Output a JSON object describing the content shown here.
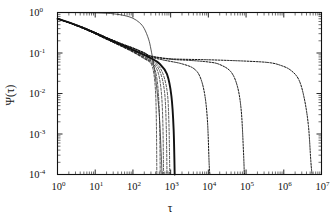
{
  "figure": {
    "title": "",
    "background": "#ffffff",
    "ink": "#111111"
  },
  "axes": {
    "xlabel": "τ",
    "ylabel": "Ψ(τ)",
    "xticks": [
      "10",
      "10",
      "10",
      "10",
      "10",
      "10",
      "10",
      "10"
    ],
    "xexp": [
      "0",
      "1",
      "2",
      "3",
      "4",
      "5",
      "6",
      "7"
    ],
    "yticks": [
      "10",
      "10",
      "10",
      "10",
      "10"
    ],
    "yexp": [
      "0",
      "-1",
      "-2",
      "-3",
      "-4"
    ],
    "xlim_label": "1e0 to 1e7",
    "ylim_label": "1e-4 to 1e0"
  },
  "chart_data": {
    "type": "line",
    "title": "",
    "xlabel": "τ",
    "ylabel": "Ψ(τ)",
    "xscale": "log",
    "yscale": "log",
    "xlim": [
      1,
      10000000
    ],
    "ylim": [
      0.0001,
      1
    ],
    "grid": false,
    "legend": "none",
    "annotations": [
      "All decaying curves bundle near Ψ≈0.07 at τ≈300 then fan out",
      "One thin curve stays at Ψ≈1 until τ≈30 before dropping steeply"
    ],
    "series": [
      {
        "name": "thin-short-1",
        "style": "dashed-thin",
        "width": 0.7,
        "points": [
          [
            1,
            0.7
          ],
          [
            2,
            0.56
          ],
          [
            5,
            0.4
          ],
          [
            10,
            0.3
          ],
          [
            20,
            0.22
          ],
          [
            50,
            0.145
          ],
          [
            100,
            0.105
          ],
          [
            200,
            0.072
          ],
          [
            300,
            0.055
          ],
          [
            360,
            0.03
          ],
          [
            400,
            0.01
          ],
          [
            420,
            0.0016
          ],
          [
            430,
            0.0001
          ]
        ]
      },
      {
        "name": "thin-short-2",
        "style": "dashed-thin",
        "width": 0.7,
        "points": [
          [
            1,
            0.7
          ],
          [
            2,
            0.56
          ],
          [
            5,
            0.4
          ],
          [
            10,
            0.3
          ],
          [
            20,
            0.22
          ],
          [
            50,
            0.147
          ],
          [
            100,
            0.107
          ],
          [
            200,
            0.074
          ],
          [
            300,
            0.058
          ],
          [
            400,
            0.034
          ],
          [
            470,
            0.011
          ],
          [
            510,
            0.0018
          ],
          [
            530,
            0.0001
          ]
        ]
      },
      {
        "name": "thin-short-3",
        "style": "dashed-thin",
        "width": 0.7,
        "points": [
          [
            1,
            0.7
          ],
          [
            2,
            0.56
          ],
          [
            5,
            0.4
          ],
          [
            10,
            0.3
          ],
          [
            20,
            0.22
          ],
          [
            50,
            0.148
          ],
          [
            100,
            0.109
          ],
          [
            200,
            0.077
          ],
          [
            300,
            0.061
          ],
          [
            450,
            0.036
          ],
          [
            560,
            0.012
          ],
          [
            620,
            0.002
          ],
          [
            650,
            0.0001
          ]
        ]
      },
      {
        "name": "thin-short-4",
        "style": "dashed-thin",
        "width": 0.7,
        "points": [
          [
            1,
            0.7
          ],
          [
            2,
            0.56
          ],
          [
            5,
            0.4
          ],
          [
            10,
            0.3
          ],
          [
            20,
            0.22
          ],
          [
            50,
            0.15
          ],
          [
            100,
            0.112
          ],
          [
            200,
            0.08
          ],
          [
            300,
            0.064
          ],
          [
            500,
            0.038
          ],
          [
            680,
            0.012
          ],
          [
            760,
            0.0019
          ],
          [
            800,
            0.0001
          ]
        ]
      },
      {
        "name": "thin-short-5",
        "style": "dashed-thin",
        "width": 0.7,
        "points": [
          [
            1,
            0.7
          ],
          [
            2,
            0.56
          ],
          [
            5,
            0.4
          ],
          [
            10,
            0.3
          ],
          [
            20,
            0.22
          ],
          [
            50,
            0.152
          ],
          [
            100,
            0.115
          ],
          [
            200,
            0.084
          ],
          [
            300,
            0.068
          ],
          [
            550,
            0.04
          ],
          [
            800,
            0.012
          ],
          [
            900,
            0.0018
          ],
          [
            950,
            0.0001
          ]
        ]
      },
      {
        "name": "thick-solid",
        "style": "solid-thick",
        "width": 1.9,
        "points": [
          [
            1,
            0.7
          ],
          [
            2,
            0.57
          ],
          [
            5,
            0.41
          ],
          [
            10,
            0.31
          ],
          [
            20,
            0.23
          ],
          [
            50,
            0.158
          ],
          [
            100,
            0.12
          ],
          [
            200,
            0.09
          ],
          [
            300,
            0.074
          ],
          [
            500,
            0.055
          ],
          [
            800,
            0.03
          ],
          [
            1050,
            0.0085
          ],
          [
            1200,
            0.0013
          ],
          [
            1280,
            0.0001
          ]
        ]
      },
      {
        "name": "thin-steep-from-unity",
        "style": "solid-thin",
        "width": 0.7,
        "points": [
          [
            1,
            1.0
          ],
          [
            5,
            0.99
          ],
          [
            15,
            0.97
          ],
          [
            30,
            0.93
          ],
          [
            60,
            0.84
          ],
          [
            100,
            0.72
          ],
          [
            150,
            0.56
          ],
          [
            200,
            0.4
          ],
          [
            260,
            0.22
          ],
          [
            300,
            0.125
          ],
          [
            350,
            0.055
          ],
          [
            420,
            0.016
          ],
          [
            500,
            0.003
          ],
          [
            560,
            0.00035
          ],
          [
            590,
            0.0001
          ]
        ]
      },
      {
        "name": "dotted-mid-1e4",
        "style": "dotted",
        "width": 1.0,
        "points": [
          [
            1,
            0.7
          ],
          [
            2,
            0.57
          ],
          [
            5,
            0.42
          ],
          [
            10,
            0.32
          ],
          [
            20,
            0.24
          ],
          [
            50,
            0.165
          ],
          [
            100,
            0.128
          ],
          [
            200,
            0.097
          ],
          [
            300,
            0.08
          ],
          [
            600,
            0.068
          ],
          [
            1000,
            0.062
          ],
          [
            2000,
            0.054
          ],
          [
            4000,
            0.042
          ],
          [
            6000,
            0.026
          ],
          [
            8000,
            0.0095
          ],
          [
            9500,
            0.002
          ],
          [
            10500,
            0.00018
          ],
          [
            11000,
            0.0001
          ]
        ]
      },
      {
        "name": "dotted-mid-1e5",
        "style": "dotted",
        "width": 1.0,
        "points": [
          [
            1,
            0.7
          ],
          [
            2,
            0.57
          ],
          [
            5,
            0.42
          ],
          [
            10,
            0.32
          ],
          [
            20,
            0.24
          ],
          [
            50,
            0.168
          ],
          [
            100,
            0.132
          ],
          [
            200,
            0.1
          ],
          [
            300,
            0.082
          ],
          [
            1000,
            0.07
          ],
          [
            3000,
            0.066
          ],
          [
            10000,
            0.06
          ],
          [
            20000,
            0.052
          ],
          [
            40000,
            0.034
          ],
          [
            60000,
            0.014
          ],
          [
            75000,
            0.0035
          ],
          [
            85000,
            0.0004
          ],
          [
            90000,
            0.0001
          ]
        ]
      },
      {
        "name": "dotted-long-5e6",
        "style": "dotted",
        "width": 1.0,
        "points": [
          [
            1,
            0.7
          ],
          [
            2,
            0.57
          ],
          [
            5,
            0.42
          ],
          [
            10,
            0.32
          ],
          [
            20,
            0.24
          ],
          [
            50,
            0.17
          ],
          [
            100,
            0.134
          ],
          [
            200,
            0.102
          ],
          [
            300,
            0.085
          ],
          [
            1000,
            0.072
          ],
          [
            10000,
            0.068
          ],
          [
            100000,
            0.063
          ],
          [
            400000,
            0.058
          ],
          [
            800000,
            0.05
          ],
          [
            1500000,
            0.038
          ],
          [
            2500000,
            0.022
          ],
          [
            3500000,
            0.0075
          ],
          [
            4500000,
            0.0016
          ],
          [
            5200000,
            0.00022
          ],
          [
            5600000,
            0.0001
          ]
        ]
      }
    ]
  }
}
